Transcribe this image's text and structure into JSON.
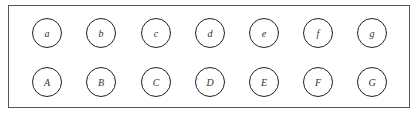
{
  "diagram": {
    "rows": [
      {
        "labels": [
          "a",
          "b",
          "c",
          "d",
          "e",
          "f",
          "g"
        ]
      },
      {
        "labels": [
          "A",
          "B",
          "C",
          "D",
          "E",
          "F",
          "G"
        ]
      }
    ]
  }
}
